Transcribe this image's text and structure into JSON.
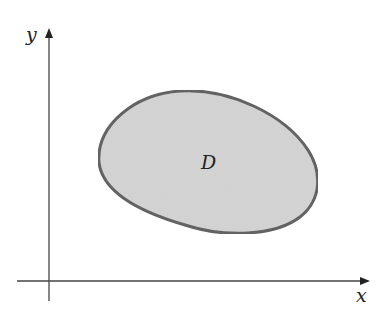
{
  "diagram": {
    "type": "region-in-plane",
    "axes": {
      "x_label": "x",
      "y_label": "y"
    },
    "region": {
      "label": "D",
      "fill_color": "#d4d4d4",
      "stroke_color": "#5a5a5a"
    },
    "axis_color": "#333333"
  }
}
